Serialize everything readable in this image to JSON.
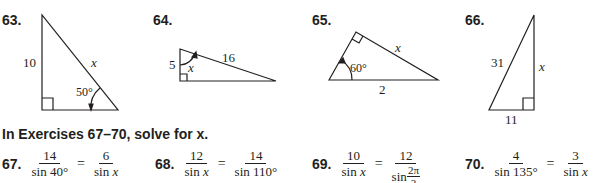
{
  "figures": [
    {
      "number": "63.",
      "side_vertical": "10",
      "hypotenuse": "x",
      "angle": "50°"
    },
    {
      "number": "64.",
      "side_vertical": "5",
      "hypotenuse": "16",
      "angle": "x"
    },
    {
      "number": "65.",
      "side_top": "x",
      "base": "2",
      "angle": "60°"
    },
    {
      "number": "66.",
      "hypotenuse": "31",
      "side_vertical": "x",
      "base": "11"
    }
  ],
  "instructions": "In Exercises 67–70, solve for x.",
  "equations": [
    {
      "number": "67.",
      "left_num": "14",
      "left_den": "sin 40°",
      "right_num": "6",
      "right_den_prefix": "sin ",
      "right_den_var": "x"
    },
    {
      "number": "68.",
      "left_num": "12",
      "left_den_prefix": "sin ",
      "left_den_var": "x",
      "right_num": "14",
      "right_den": "sin 110°"
    },
    {
      "number": "69.",
      "left_num": "10",
      "left_den_prefix": "sin ",
      "left_den_var": "x",
      "right_num": "12",
      "right_den_prefix": "sin ",
      "right_den_frac_num": "2π",
      "right_den_frac_den": "3"
    },
    {
      "number": "70.",
      "left_num": "4",
      "left_den": "sin 135°",
      "right_num": "3",
      "right_den_prefix": "sin ",
      "right_den_var": "x"
    }
  ],
  "equals": "="
}
